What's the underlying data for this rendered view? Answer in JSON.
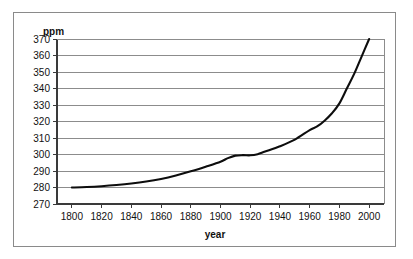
{
  "chart_data": {
    "type": "line",
    "title": "",
    "xlabel": "year",
    "ylabel": "ppm",
    "ylim": [
      270,
      370
    ],
    "xlim": [
      1790,
      2010
    ],
    "grid": true,
    "legend": "none",
    "y_ticks": [
      370,
      360,
      350,
      340,
      330,
      320,
      310,
      300,
      290,
      280,
      270
    ],
    "x_ticks": [
      1800,
      1820,
      1840,
      1860,
      1880,
      1900,
      1920,
      1940,
      1960,
      1980,
      2000
    ],
    "series": [
      {
        "name": "CO2 concentration",
        "color": "#0d0d0d",
        "x": [
          1800,
          1810,
          1820,
          1830,
          1840,
          1850,
          1860,
          1870,
          1880,
          1890,
          1900,
          1905,
          1910,
          1915,
          1920,
          1925,
          1930,
          1940,
          1950,
          1960,
          1965,
          1970,
          1975,
          1980,
          1985,
          1990,
          1995,
          2000
        ],
        "y": [
          280.0,
          280.3,
          280.8,
          281.5,
          282.4,
          283.6,
          285.2,
          287.3,
          289.8,
          292.6,
          295.6,
          297.8,
          299.3,
          299.6,
          299.5,
          300.2,
          301.8,
          305.0,
          309.0,
          314.8,
          317.0,
          320.5,
          325.0,
          331.0,
          340.0,
          349.0,
          359.5,
          370.0
        ]
      }
    ]
  },
  "axis": {
    "y_unit_label": "ppm",
    "x_title": "year"
  }
}
